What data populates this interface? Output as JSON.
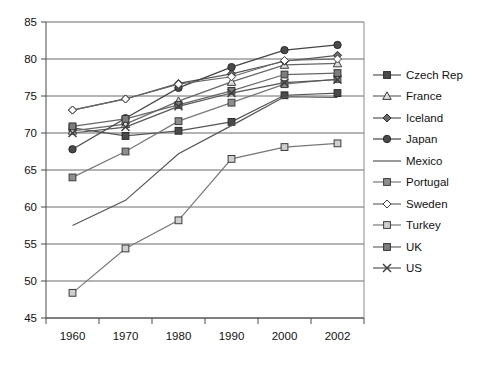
{
  "chart_data": {
    "type": "line",
    "title": "",
    "xlabel": "",
    "ylabel": "",
    "categories": [
      "1960",
      "1970",
      "1980",
      "1990",
      "2000",
      "2002"
    ],
    "ylim": [
      45,
      85
    ],
    "yticks": [
      "45",
      "50",
      "55",
      "60",
      "65",
      "70",
      "75",
      "80",
      "85"
    ],
    "grid": true,
    "legend_position": "right",
    "series": [
      {
        "name": "Czech Rep",
        "marker": "filled-square-dark",
        "color": "#555555",
        "values": [
          70.7,
          69.6,
          70.3,
          71.5,
          75.1,
          75.4
        ]
      },
      {
        "name": "France",
        "marker": "open-triangle",
        "color": "#666666",
        "values": [
          70.3,
          71.2,
          74.3,
          76.9,
          79.2,
          79.4
        ]
      },
      {
        "name": "Iceland",
        "marker": "filled-diamond-dark",
        "color": "#555555",
        "values": [
          73.1,
          74.6,
          76.7,
          78.0,
          79.7,
          80.5
        ]
      },
      {
        "name": "Japan",
        "marker": "filled-circle-dark",
        "color": "#444444",
        "values": [
          67.8,
          72.0,
          76.1,
          78.9,
          81.2,
          81.9
        ]
      },
      {
        "name": "Mexico",
        "marker": "none",
        "color": "#555555",
        "values": [
          57.5,
          60.9,
          67.2,
          71.0,
          74.9,
          74.8
        ]
      },
      {
        "name": "Portugal",
        "marker": "filled-square-gray",
        "color": "#777777",
        "values": [
          64.0,
          67.5,
          71.6,
          74.1,
          76.6,
          77.3
        ]
      },
      {
        "name": "Sweden",
        "marker": "open-diamond",
        "color": "#666666",
        "values": [
          73.1,
          74.6,
          76.6,
          77.6,
          79.8,
          80.0
        ]
      },
      {
        "name": "Turkey",
        "marker": "open-square-light",
        "color": "#777777",
        "values": [
          48.4,
          54.4,
          58.2,
          66.5,
          68.1,
          68.6
        ]
      },
      {
        "name": "UK",
        "marker": "filled-square-midgray",
        "color": "#666666",
        "values": [
          70.9,
          71.9,
          73.8,
          75.7,
          77.9,
          78.1
        ]
      },
      {
        "name": "US",
        "marker": "cross-x",
        "color": "#555555",
        "values": [
          70.0,
          70.8,
          73.6,
          75.4,
          76.8,
          77.2
        ]
      }
    ]
  }
}
